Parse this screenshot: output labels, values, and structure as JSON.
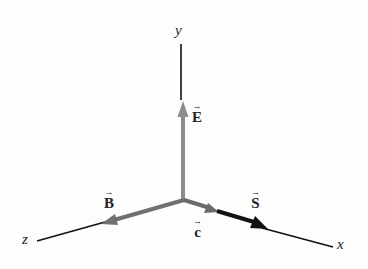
{
  "diagram": {
    "type": "3d-vector-axes",
    "axes": {
      "x": {
        "label": "x"
      },
      "y": {
        "label": "y"
      },
      "z": {
        "label": "z"
      }
    },
    "vectors": {
      "E": {
        "label": "E",
        "direction": "+y",
        "color": "#8c8c8c"
      },
      "B": {
        "label": "B",
        "direction": "+z",
        "color": "#707070"
      },
      "c": {
        "label": "c",
        "direction": "+x",
        "color": "#6a6a6a"
      },
      "S": {
        "label": "S",
        "direction": "+x",
        "color": "#111111"
      }
    },
    "arrow_glyph": "→"
  }
}
